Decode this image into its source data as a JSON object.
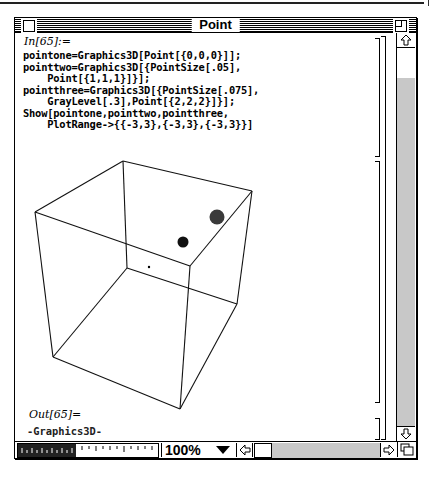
{
  "window": {
    "title": "Point"
  },
  "notebook": {
    "input_label": "In[65]:=",
    "input_lines": [
      "pointone=Graphics3D[Point[{0,0,0}]];",
      "pointtwo=Graphics3D[{PointSize[.05],",
      "    Point[{1,1,1}]}];",
      "pointthree=Graphics3D[{PointSize[.075],",
      "    GrayLevel[.3],Point[{2,2,2}]}];",
      "Show[pointone,pointtwo,pointthree,",
      "    PlotRange->{{-3,3},{-3,3},{-3,3}}]"
    ],
    "output_label": "Out[65]=",
    "output_value": "-Graphics3D-",
    "graphic": {
      "description": "3D bounding box with three points",
      "points": [
        {
          "coords": "{0,0,0}",
          "size": "default",
          "gray": "black"
        },
        {
          "coords": "{1,1,1}",
          "size": ".05",
          "gray": "black"
        },
        {
          "coords": "{2,2,2}",
          "size": ".075",
          "gray": ".3"
        }
      ]
    }
  },
  "statusbar": {
    "magnification": "100%"
  },
  "icons": {
    "close_box": "close-box-icon",
    "zoom_box": "zoom-box-icon",
    "scroll_up": "arrow-up-icon",
    "scroll_down": "arrow-down-icon",
    "scroll_left": "arrow-left-icon",
    "scroll_right": "arrow-right-icon",
    "magnification_menu": "triangle-down-icon",
    "resize": "resize-icon"
  }
}
